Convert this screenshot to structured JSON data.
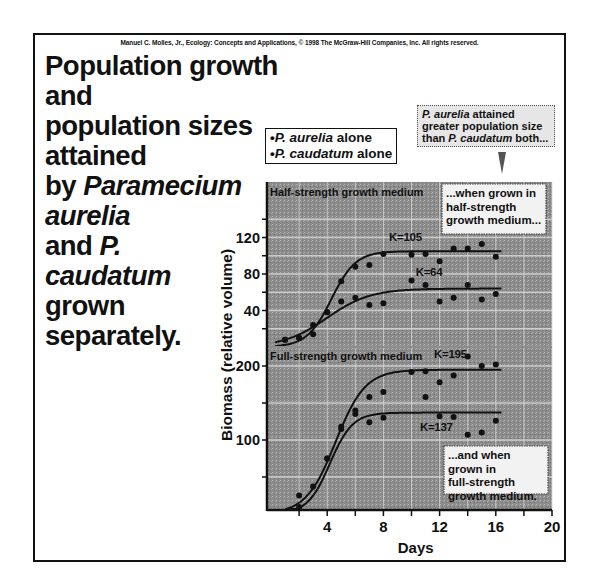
{
  "copyright": "Manuel C. Molles, Jr., Ecology: Concepts and Applications, © 1998 The McGraw-Hill Companies, Inc. All rights reserved.",
  "title": {
    "line1": "Population growth and",
    "line2": "population sizes attained",
    "line3_pre": "by ",
    "line3_italic": "Paramecium",
    "line4_italic": "aurelia",
    "line5_pre": "and ",
    "line5_italic": "P.",
    "line6_italic": "caudatum",
    "line7": "grown",
    "line8": "separately."
  },
  "legend": {
    "items": [
      {
        "species": "P. aurelia",
        "suffix": " alone"
      },
      {
        "species": "P. caudatum",
        "suffix": " alone"
      }
    ]
  },
  "callouts": {
    "top": {
      "italic1": "P. aurelia",
      "text1": " attained greater population size than ",
      "italic2": "P. caudatum",
      "text2": " both..."
    },
    "half": "...when grown in half-strength growth medium...",
    "full": "...and when grown in full-strength growth medium."
  },
  "colors": {
    "plot_bg": "#8c8c8c",
    "grid": "#d8d8d8",
    "line": "#111111",
    "point": "#111111"
  },
  "chart_data": [
    {
      "type": "scatter",
      "title": "Half-strength growth medium",
      "xlabel": "Days",
      "ylabel": "Biomass (relative volume)",
      "xlim": [
        0,
        20
      ],
      "xticks": [
        4,
        8,
        12,
        16,
        20
      ],
      "ylim": [
        0,
        140
      ],
      "yticks": [
        40,
        80,
        120
      ],
      "grid": true,
      "series": [
        {
          "name": "P. aurelia alone",
          "K_label": "K=105",
          "K": 105,
          "x": [
            1,
            2,
            3,
            4,
            5,
            6,
            7,
            8,
            10,
            11,
            12,
            13,
            14,
            15,
            16
          ],
          "y": [
            8,
            10,
            24,
            38,
            72,
            88,
            90,
            102,
            101,
            102,
            94,
            108,
            108,
            113,
            99
          ]
        },
        {
          "name": "P. caudatum alone",
          "K_label": "K=64",
          "K": 64,
          "x": [
            1,
            2,
            3,
            4,
            5,
            6,
            7,
            8,
            10,
            11,
            12,
            13,
            14,
            15,
            16
          ],
          "y": [
            8,
            10,
            14,
            38,
            50,
            54,
            46,
            48,
            73,
            68,
            50,
            54,
            68,
            52,
            58
          ]
        }
      ]
    },
    {
      "type": "scatter",
      "title": "Full-strength growth medium",
      "xlabel": "Days",
      "ylabel": "Biomass (relative volume)",
      "xlim": [
        0,
        20
      ],
      "xticks": [
        4,
        8,
        12,
        16,
        20
      ],
      "ylim": [
        5,
        210
      ],
      "yticks": [
        100,
        200
      ],
      "grid": true,
      "series": [
        {
          "name": "P. aurelia alone",
          "K_label": "K=195",
          "K": 195,
          "x": [
            2,
            4,
            5,
            6,
            7,
            8,
            10,
            11,
            12,
            13,
            14,
            15,
            16
          ],
          "y": [
            25,
            75,
            115,
            135,
            158,
            165,
            192,
            193,
            178,
            187,
            213,
            200,
            202
          ]
        },
        {
          "name": "P. caudatum alone",
          "K_label": "K=137",
          "K": 137,
          "x": [
            2,
            3,
            4,
            5,
            6,
            7,
            8,
            11,
            12,
            13,
            14,
            15,
            16
          ],
          "y": [
            8,
            37,
            75,
            118,
            140,
            124,
            130,
            158,
            132,
            131,
            107,
            110,
            126
          ]
        }
      ]
    }
  ],
  "axes": {
    "y_label": "Biomass (relative volume)",
    "x_label": "Days",
    "x_ticks": [
      "4",
      "8",
      "12",
      "16",
      "20"
    ],
    "half_y_ticks": [
      "120",
      "80",
      "40"
    ],
    "full_y_ticks": [
      "200",
      "100"
    ],
    "half_panel_title": "Half-strength growth medium",
    "full_panel_title": "Full-strength growth medium"
  }
}
